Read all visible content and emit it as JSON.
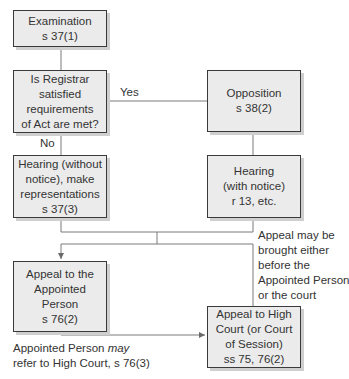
{
  "diagram": {
    "type": "flowchart",
    "nodes": {
      "examination": {
        "lines": [
          "Examination",
          "s 37(1)"
        ]
      },
      "decision": {
        "lines": [
          "Is Registrar",
          "satisfied",
          "requirements",
          "of Act are met?"
        ]
      },
      "opposition": {
        "lines": [
          "Opposition",
          "s 38(2)"
        ]
      },
      "hearing_without_notice": {
        "lines": [
          "Hearing (without",
          "notice), make",
          "representations",
          "s 37(3)"
        ]
      },
      "hearing_with_notice": {
        "lines": [
          "Hearing",
          "(with notice)",
          "r 13, etc."
        ]
      },
      "appeal_appointed_person": {
        "lines": [
          "Appeal to the",
          "Appointed",
          "Person",
          "s 76(2)"
        ]
      },
      "appeal_high_court": {
        "lines": [
          "Appeal to High",
          "Court (or Court",
          "of Session)",
          "ss 75, 76(2)"
        ]
      }
    },
    "edge_labels": {
      "yes": "Yes",
      "no": "No",
      "appeal_note": [
        "Appeal may be",
        "brought either",
        "before the",
        "Appointed Person",
        "or the court"
      ],
      "refer_note": {
        "line1_prefix": "Appointed Person ",
        "line1_emphasis": "may",
        "line2": "refer to High Court, s 76(3)"
      }
    },
    "edges": [
      {
        "from": "examination",
        "to": "decision"
      },
      {
        "from": "decision",
        "to": "opposition",
        "label": "Yes"
      },
      {
        "from": "decision",
        "to": "hearing_without_notice",
        "label": "No"
      },
      {
        "from": "opposition",
        "to": "hearing_with_notice"
      },
      {
        "from": "hearing_without_notice",
        "to": "appeal_appointed_person"
      },
      {
        "from": "hearing_without_notice",
        "to": "appeal_high_court"
      },
      {
        "from": "hearing_with_notice",
        "to": "appeal_appointed_person"
      },
      {
        "from": "hearing_with_notice",
        "to": "appeal_high_court"
      },
      {
        "from": "appeal_appointed_person",
        "to": "appeal_high_court",
        "label": "Appointed Person may refer to High Court, s 76(3)"
      }
    ],
    "colors": {
      "box_fill": "#ebebeb",
      "box_border": "#3a3a3a",
      "box_shadow": "#cfcfcf",
      "connector": "#6a6a6a",
      "text": "#333333"
    }
  }
}
